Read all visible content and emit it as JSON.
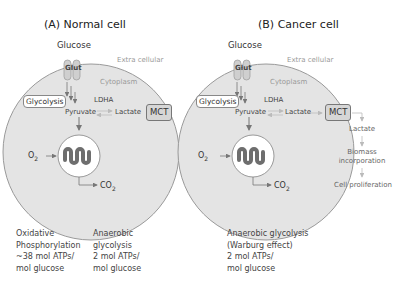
{
  "panel_a": {
    "title": "(A) Normal cell",
    "glucose": "Glucose",
    "glut": "Glut",
    "extracellular": "Extra cellular",
    "cytoplasm": "Cytoplasm",
    "glycolysis": "Glycolysis",
    "ldha": "LDHA",
    "pyruvate": "Pyruvate",
    "lactate": "Lactate",
    "mct": "MCT",
    "o2": "O",
    "o2_sub": "2",
    "co2": "CO",
    "co2_sub": "2",
    "note_left": [
      "Oxidative",
      "Phosphorylation",
      "~38 mol ATPs/",
      "mol glucose"
    ],
    "note_right": [
      "Anaerobic",
      "glycolysis",
      "2 mol ATPs/",
      "mol glucose"
    ]
  },
  "panel_b": {
    "title": "(B) Cancer cell",
    "glucose": "Glucose",
    "glut": "Glut",
    "extracellular": "Extra cellular",
    "cytoplasm": "Cytoplasm",
    "glycolysis": "Glycolysis",
    "ldha": "LDHA",
    "pyruvate": "Pyruvate",
    "lactate": "Lactate",
    "mct": "MCT",
    "o2": "O",
    "o2_sub": "2",
    "co2": "CO",
    "co2_sub": "2",
    "out_lactate": "Lactate",
    "biomass": [
      "Biomass",
      "incorporation"
    ],
    "proliferation": "Cell proliferation",
    "note": [
      "Anaerobic glycolysis",
      "(Warburg effect)",
      "2 mol ATPs/",
      "mol glucose"
    ]
  },
  "colors": {
    "cell_fill": "#e4e4e4",
    "cell_stroke": "#9a9a9a",
    "mito_wave": "#6e6e6e",
    "arrow": "#777777",
    "arrow_light": "#bbbbbb"
  }
}
